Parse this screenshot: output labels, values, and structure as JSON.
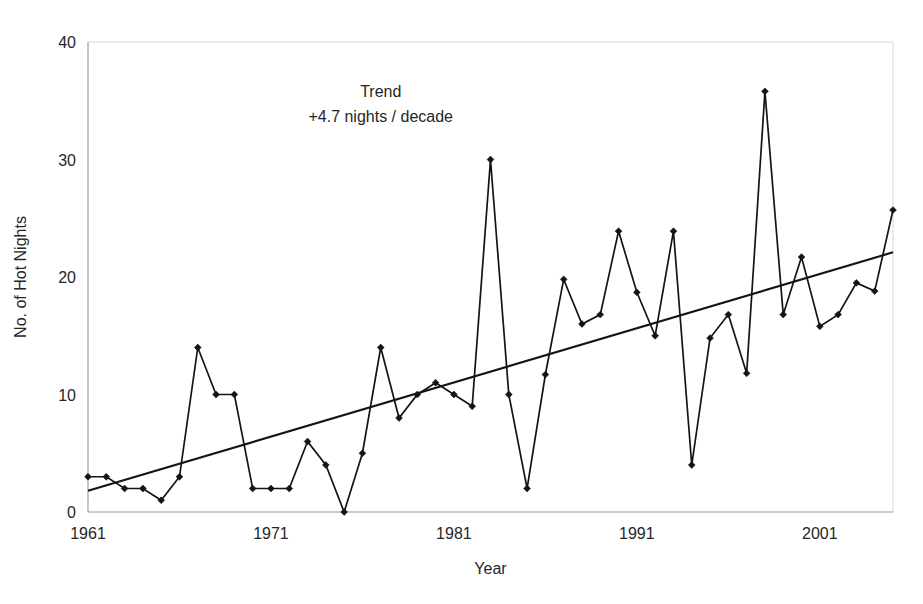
{
  "chart_data": {
    "type": "line",
    "title": "",
    "xlabel": "Year",
    "ylabel": "No. of Hot Nights",
    "xlim": [
      1961,
      2005
    ],
    "ylim": [
      0,
      40
    ],
    "grid": false,
    "legend": "none",
    "x_ticks": [
      "1961",
      "1971",
      "1981",
      "1991",
      "2001"
    ],
    "x_tick_values": [
      1961,
      1971,
      1981,
      1991,
      2001
    ],
    "y_ticks": [
      "0",
      "10",
      "20",
      "30",
      "40"
    ],
    "y_tick_values": [
      0,
      10,
      20,
      30,
      40
    ],
    "x": [
      1961,
      1962,
      1963,
      1964,
      1965,
      1966,
      1967,
      1968,
      1969,
      1970,
      1971,
      1972,
      1973,
      1974,
      1975,
      1976,
      1977,
      1978,
      1979,
      1980,
      1981,
      1982,
      1983,
      1984,
      1985,
      1986,
      1987,
      1988,
      1989,
      1990,
      1991,
      1992,
      1993,
      1994,
      1995,
      1996,
      1997,
      1998,
      1999,
      2000,
      2001,
      2002,
      2003,
      2004,
      2005
    ],
    "series": [
      {
        "name": "No. of Hot Nights",
        "marker": "diamond",
        "color": "#141414",
        "values": [
          3,
          3,
          2,
          2,
          1,
          3,
          14,
          10,
          10,
          2,
          2,
          2,
          6,
          4,
          0,
          5,
          14,
          8,
          10,
          11,
          10,
          9,
          30,
          10,
          2,
          11.7,
          19.8,
          16,
          16.8,
          23.9,
          18.7,
          15,
          23.9,
          4,
          14.8,
          16.8,
          11.8,
          35.8,
          16.8,
          21.7,
          15.8,
          16.8,
          19.5,
          18.8,
          25.7
        ]
      }
    ],
    "trend": {
      "name": "Trend",
      "color": "#141414",
      "slope_per_decade": 4.7,
      "x_start": 1961,
      "x_end": 2005,
      "y_start": 1.8,
      "y_end": 22.1
    },
    "annotations": [
      {
        "name": "trend-label-line1",
        "text": "Trend",
        "x": 1977.0,
        "y": 35.3
      },
      {
        "name": "trend-label-line2",
        "text": "+4.7 nights / decade",
        "x": 1977.0,
        "y": 33.2
      }
    ]
  }
}
